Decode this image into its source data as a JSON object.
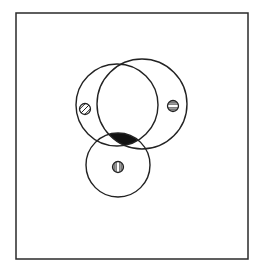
{
  "diagram": {
    "frame": {
      "x": 16,
      "y": 13,
      "width": 232,
      "height": 246,
      "stroke": "#2a2a2a"
    },
    "stroke_color": "#222222",
    "fill_color": "#111111",
    "circles": [
      {
        "id": "left",
        "cx": 117,
        "cy": 105,
        "r": 41,
        "symbol": "diagonal-hatch",
        "symbol_x": 85,
        "symbol_y": 109
      },
      {
        "id": "right",
        "cx": 142,
        "cy": 104,
        "r": 45,
        "symbol": "horizontal-hatch",
        "symbol_x": 173,
        "symbol_y": 106
      },
      {
        "id": "bottom",
        "cx": 118,
        "cy": 165,
        "r": 32,
        "symbol": "vertical-hatch",
        "symbol_x": 118,
        "symbol_y": 167
      }
    ],
    "shaded_region": "intersection of left, right and bottom circles",
    "symbol_radius": 5.5
  }
}
